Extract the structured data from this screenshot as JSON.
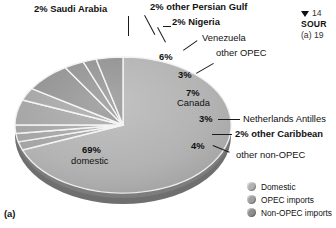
{
  "figure": {
    "panel_label": "(a)",
    "caption_marker": "▼",
    "caption_number": "14",
    "caption_source": "SOUR",
    "caption_note": "(a) 19"
  },
  "chart_data": {
    "type": "pie",
    "title": "",
    "xlabel": "",
    "ylabel": "",
    "total": 100,
    "categories": [
      "domestic",
      "Saudi Arabia",
      "other Persian Gulf",
      "Nigeria",
      "Venezuela",
      "other OPEC",
      "Canada",
      "Netherlands Antilles",
      "other Caribbean",
      "other non-OPEC"
    ],
    "values": [
      69,
      2,
      2,
      2,
      6,
      3,
      7,
      3,
      2,
      4
    ],
    "groups": [
      "Domestic",
      "OPEC imports",
      "OPEC imports",
      "OPEC imports",
      "OPEC imports",
      "OPEC imports",
      "Non-OPEC imports",
      "Non-OPEC imports",
      "Non-OPEC imports",
      "Non-OPEC imports"
    ],
    "slices": [
      {
        "label": "domestic",
        "pct": "69%",
        "name": "domestic",
        "value": 69
      },
      {
        "label": "2% Saudi Arabia",
        "pct": "2%",
        "name": "Saudi Arabia",
        "value": 2
      },
      {
        "label": "2% other Persian Gulf",
        "pct": "2%",
        "name": "other Persian Gulf",
        "value": 2
      },
      {
        "label": "2% Nigeria",
        "pct": "2%",
        "name": "Nigeria",
        "value": 2
      },
      {
        "label": "Venezuela",
        "pct": "6%",
        "name": "Venezuela",
        "value": 6
      },
      {
        "label": "other OPEC",
        "pct": "3%",
        "name": "other OPEC",
        "value": 3
      },
      {
        "label": "Canada",
        "pct": "7%",
        "name": "Canada",
        "value": 7
      },
      {
        "label": "Netherlands Antilles",
        "pct": "3%",
        "name": "Netherlands Antilles",
        "value": 3
      },
      {
        "label": "2% other Caribbean",
        "pct": "2%",
        "name": "other Caribbean",
        "value": 2
      },
      {
        "label": "other non-OPEC",
        "pct": "4%",
        "name": "other non-OPEC",
        "value": 4
      }
    ],
    "legend": {
      "position": "bottom-right",
      "entries": [
        {
          "label": "Domestic",
          "color": "#b2b2b2"
        },
        {
          "label": "OPEC imports",
          "color": "#a0a0a0"
        },
        {
          "label": "Non-OPEC imports",
          "color": "#8e8e8e"
        }
      ]
    },
    "grid": false
  },
  "labels": {
    "saudi_arabia": "2% Saudi Arabia",
    "other_persian_gulf": "2% other Persian Gulf",
    "nigeria": "2% Nigeria",
    "venezuela": "Venezuela",
    "venezuela_pct": "6%",
    "other_opec": "other OPEC",
    "other_opec_pct": "3%",
    "canada_pct": "7%",
    "canada": "Canada",
    "neth_pct": "3%",
    "neth": "Netherlands Antilles",
    "other_caribbean": "2% other Caribbean",
    "other_nonopec_pct": "4%",
    "other_nonopec": "other non-OPEC",
    "domestic_pct": "69%",
    "domestic": "domestic"
  },
  "colors": {
    "domestic": "#b2b2b2",
    "opec": "#a3a3a3",
    "nonopec": "#8f8f8f",
    "side_wall": "#7d7d7d",
    "separator": "#f2f2f2",
    "text": "#111111"
  }
}
